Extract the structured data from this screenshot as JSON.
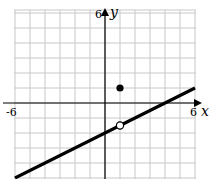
{
  "chart_data": {
    "type": "line",
    "title": "",
    "xlabel": "x",
    "ylabel": "y",
    "xlim": [
      -6,
      6
    ],
    "ylim": [
      -5,
      6
    ],
    "grid": true,
    "grid_step": 1,
    "tick_labels": {
      "x_min": "-6",
      "x_max": "6",
      "y_max": "6"
    },
    "series": [
      {
        "name": "f(x) = 0.5x - 2",
        "kind": "line",
        "slope": 0.5,
        "intercept": -2,
        "x": [
          -6,
          6
        ],
        "y": [
          -5,
          1
        ]
      }
    ],
    "points": [
      {
        "name": "open-circle",
        "x": 1,
        "y": -1.5,
        "filled": false
      },
      {
        "name": "filled-dot",
        "x": 1,
        "y": 1,
        "filled": true
      }
    ],
    "legend": null
  },
  "labels": {
    "x_axis": "x",
    "y_axis": "y",
    "x_min": "-6",
    "x_max": "6",
    "y_max": "6"
  },
  "colors": {
    "grid": "#c8c8c8",
    "axis": "#000000",
    "line": "#000000",
    "background": "#ffffff"
  }
}
